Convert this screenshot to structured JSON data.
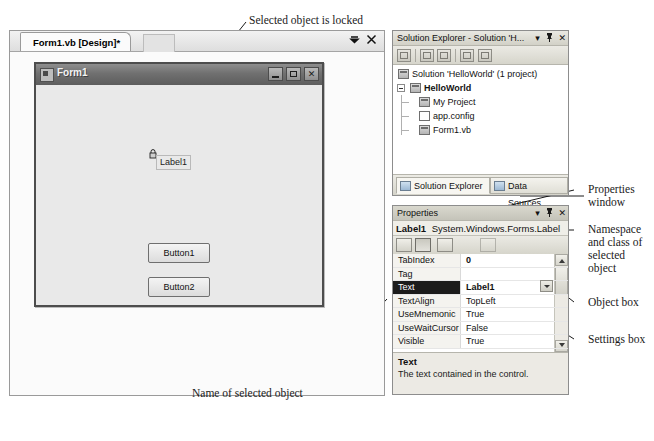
{
  "annotations": {
    "locked": "Selected object is locked",
    "properties_window": "Properties\nwindow",
    "namespace_class": "Namespace\nand class of\nselected\nobject",
    "object_box": "Object box",
    "settings_box": "Settings box",
    "name_of_selected": "Name of selected object"
  },
  "designer": {
    "tab_label": "Form1.vb [Design]*",
    "tabstrip_menu_icon": "chevron-down-icon",
    "tabstrip_close_icon": "close-icon"
  },
  "winform": {
    "title": "Form1",
    "minimize_label": "minimize-icon",
    "maximize_label": "maximize-icon",
    "close_label": "✕",
    "label_text": "Label1",
    "lock_icon": "lock-icon",
    "buttons": [
      "Button1",
      "Button2"
    ]
  },
  "solution_explorer": {
    "title": "Solution Explorer - Solution 'H...",
    "ctrl_dropdown": "▾",
    "ctrl_pin": "☩",
    "ctrl_close": "✕",
    "toolbar_icons": [
      "properties-icon",
      "show-all-files-icon",
      "refresh-icon",
      "view-code-icon",
      "view-designer-icon"
    ],
    "tree": [
      {
        "label": "Solution 'HelloWorld' (1 project)",
        "bold": false
      },
      {
        "label": "HelloWorld",
        "bold": true
      },
      {
        "label": "My Project",
        "bold": false
      },
      {
        "label": "app.config",
        "bold": false
      },
      {
        "label": "Form1.vb",
        "bold": false
      }
    ],
    "dock_tabs": [
      {
        "label": "Solution Explorer",
        "active": true
      },
      {
        "label": "Data Sources",
        "active": false
      }
    ]
  },
  "properties": {
    "title": "Properties",
    "ctrl_dropdown": "▾",
    "ctrl_pin": "☩",
    "ctrl_close": "✕",
    "object_name": "Label1",
    "object_class": "System.Windows.Forms.Label",
    "toolbar_icons": [
      "categorized-icon",
      "alphabetical-icon",
      "properties-page-icon",
      "events-icon",
      "property-pages-icon"
    ],
    "rows": [
      {
        "name": "TabIndex",
        "value": "0",
        "bold": true,
        "selected": false
      },
      {
        "name": "Tag",
        "value": "",
        "bold": false,
        "selected": false
      },
      {
        "name": "Text",
        "value": "Label1",
        "bold": true,
        "selected": true
      },
      {
        "name": "TextAlign",
        "value": "TopLeft",
        "bold": false,
        "selected": false
      },
      {
        "name": "UseMnemonic",
        "value": "True",
        "bold": false,
        "selected": false
      },
      {
        "name": "UseWaitCursor",
        "value": "False",
        "bold": false,
        "selected": false
      },
      {
        "name": "Visible",
        "value": "True",
        "bold": false,
        "selected": false
      }
    ],
    "description_title": "Text",
    "description_text": "The text contained in the control."
  },
  "colors": {
    "panel_bg": "#f1f0ea",
    "form_bg": "#e9e9e9",
    "selection": "#1b1b1b",
    "border": "#8d8d8d"
  }
}
